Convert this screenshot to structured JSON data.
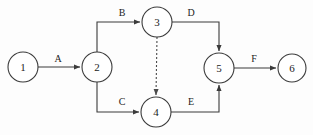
{
  "diagram": {
    "type": "activity-on-arrow-network",
    "title": "",
    "background_color": "#fdfdfd",
    "stroke_color": "#3b3b3b",
    "text_color": "#232323",
    "nodes": [
      {
        "id": "1",
        "label": "1",
        "cx": 23,
        "cy": 67,
        "r": 15
      },
      {
        "id": "2",
        "label": "2",
        "cx": 97,
        "cy": 67,
        "r": 15
      },
      {
        "id": "3",
        "label": "3",
        "cx": 157,
        "cy": 22,
        "r": 15
      },
      {
        "id": "4",
        "label": "4",
        "cx": 156,
        "cy": 112,
        "r": 15
      },
      {
        "id": "5",
        "label": "5",
        "cx": 219,
        "cy": 68,
        "r": 15
      },
      {
        "id": "6",
        "label": "6",
        "cx": 292,
        "cy": 68,
        "r": 14
      }
    ],
    "edges": [
      {
        "id": "A",
        "label": "A",
        "from": "1",
        "to": "2",
        "style": "solid",
        "arrow": true,
        "path": "M 38 67 L 80 67",
        "label_x": 58,
        "label_y": 58
      },
      {
        "id": "B",
        "label": "B",
        "from": "2",
        "to": "3",
        "style": "solid",
        "arrow": true,
        "path": "M 97 52 L 97 22 L 140 22",
        "label_x": 122,
        "label_y": 12
      },
      {
        "id": "C",
        "label": "C",
        "from": "2",
        "to": "4",
        "style": "solid",
        "arrow": true,
        "path": "M 97 82 L 97 112 L 139 112",
        "label_x": 122,
        "label_y": 101
      },
      {
        "id": "D",
        "label": "D",
        "from": "3",
        "to": "5",
        "style": "solid",
        "arrow": true,
        "path": "M 172 22 L 219 22 L 219 51",
        "label_x": 191,
        "label_y": 12
      },
      {
        "id": "E",
        "label": "E",
        "from": "4",
        "to": "5",
        "style": "solid",
        "arrow": true,
        "path": "M 171 112 L 219 112 L 219 85",
        "label_x": 191,
        "label_y": 101
      },
      {
        "id": "F",
        "label": "F",
        "from": "5",
        "to": "6",
        "style": "solid",
        "arrow": true,
        "path": "M 234 68 L 276 68",
        "label_x": 254,
        "label_y": 58
      },
      {
        "id": "dummy",
        "label": "",
        "from": "3",
        "to": "4",
        "style": "dashed",
        "arrow": true,
        "path": "M 157 37 L 156 95",
        "label_x": 0,
        "label_y": 0
      }
    ]
  }
}
